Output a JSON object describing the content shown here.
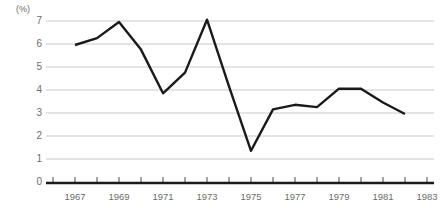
{
  "chart_data": {
    "type": "line",
    "title": "",
    "subtitle": "",
    "xlabel": "",
    "ylabel": "(%)",
    "unit_label": "(%)",
    "grid": true,
    "legend": "none",
    "xlim": [
      1966,
      1983
    ],
    "ylim": [
      0,
      7.5
    ],
    "ytick_labels": [
      "7",
      "6",
      "5",
      "4",
      "3",
      "2",
      "1",
      "0"
    ],
    "ytick_values": [
      7,
      6,
      5,
      4,
      3,
      2,
      1,
      0
    ],
    "xtick_labels": [
      "1967",
      "1969",
      "1971",
      "1973",
      "1975",
      "1977",
      "1979",
      "1981",
      "1983"
    ],
    "xtick_values": [
      1967,
      1969,
      1971,
      1973,
      1975,
      1977,
      1979,
      1981,
      1983
    ],
    "minor_xticks": [
      1966,
      1967,
      1968,
      1969,
      1970,
      1971,
      1972,
      1973,
      1974,
      1975,
      1976,
      1977,
      1978,
      1979,
      1980,
      1981,
      1982,
      1983
    ],
    "series": [
      {
        "name": "series-1",
        "color": "#1a1a1a",
        "x": [
          1967,
          1968,
          1969,
          1970,
          1971,
          1972,
          1973,
          1974,
          1975,
          1976,
          1977,
          1978,
          1979,
          1980,
          1981,
          1982
        ],
        "values": [
          6.0,
          6.3,
          7.0,
          5.8,
          3.9,
          4.8,
          7.1,
          4.2,
          1.4,
          3.2,
          3.4,
          3.3,
          4.1,
          4.1,
          3.5,
          3.0
        ]
      }
    ],
    "colors": {
      "line": "#1a1a1a",
      "grid": "#c9c9c9",
      "axis": "#1a1a1a",
      "text": "#6d6d6d",
      "background": "#ffffff"
    }
  }
}
